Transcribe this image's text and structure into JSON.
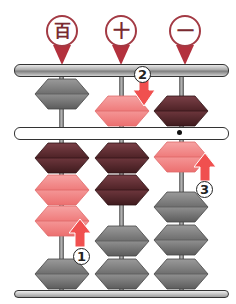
{
  "diagram": {
    "columns": [
      {
        "label": "百",
        "meaning": "hundreds",
        "upper_bead": {
          "color": "gray",
          "state": "up"
        },
        "lower_beads": [
          "dark",
          "pink",
          "pink",
          "gray"
        ],
        "lower_pushed_count": 3
      },
      {
        "label": "十",
        "meaning": "tens",
        "upper_bead": {
          "color": "pink",
          "state": "down"
        },
        "lower_beads": [
          "dark",
          "dark",
          "gray",
          "gray"
        ],
        "lower_pushed_count": 2
      },
      {
        "label": "一",
        "meaning": "ones",
        "upper_bead": {
          "color": "dark",
          "state": "down"
        },
        "lower_beads": [
          "pink",
          "gray",
          "gray",
          "gray"
        ],
        "lower_pushed_count": 1
      }
    ],
    "steps": [
      {
        "number": "1",
        "direction": "up",
        "column": "百"
      },
      {
        "number": "2",
        "direction": "down",
        "column": "十"
      },
      {
        "number": "3",
        "direction": "up",
        "column": "一"
      }
    ],
    "unit_dot_column": "一",
    "colors": {
      "marker": "#a33a44",
      "pink_bead": "#f28b8b",
      "dark_bead": "#5a2a2e",
      "gray_bead": "#8a8a8a",
      "arrow": "#f0504f"
    }
  }
}
